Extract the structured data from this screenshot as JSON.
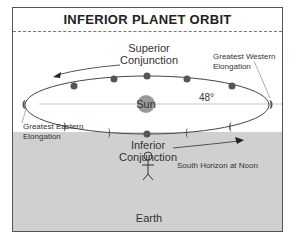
{
  "title": "INFERIOR PLANET ORBIT",
  "labels": {
    "superior_conjunction_1": "Superior",
    "superior_conjunction_2": "Conjunction",
    "greatest_western_1": "Greatest Western",
    "greatest_western_2": "Elongation",
    "greatest_eastern_1": "Greatest Eastern",
    "greatest_eastern_2": "Elongation",
    "inferior_conjunction_1": "Inferior",
    "inferior_conjunction_2": "Conjunction",
    "sun": "Sun",
    "angle": "48°",
    "horizon": "South Horizon at Noon",
    "earth": "Earth"
  },
  "colors": {
    "planet": "#555555",
    "sun": "#999999",
    "ground": "#d0d0d0",
    "line": "#444444"
  }
}
